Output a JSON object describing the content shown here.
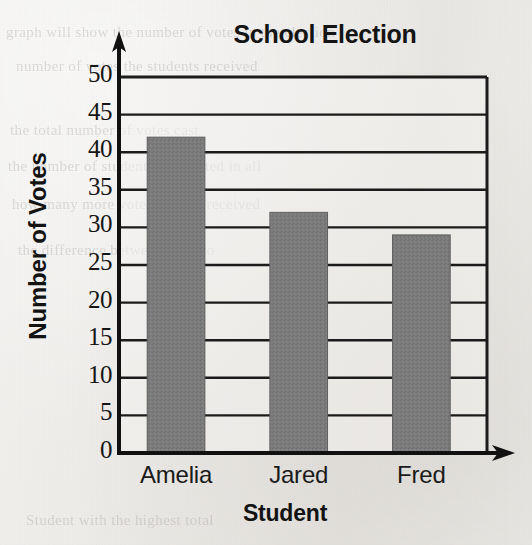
{
  "chart_data": {
    "type": "bar",
    "title": "School Election",
    "xlabel": "Student",
    "ylabel": "Number of Votes",
    "categories": [
      "Amelia",
      "Jared",
      "Fred"
    ],
    "values": [
      42,
      32,
      29
    ],
    "ylim": [
      0,
      50
    ],
    "ytick_values": [
      0,
      5,
      10,
      15,
      20,
      25,
      30,
      35,
      40,
      45,
      50
    ],
    "ytick_labels": [
      "0",
      "5",
      "10",
      "15",
      "20",
      "25",
      "30",
      "35",
      "40",
      "45",
      "50"
    ],
    "grid": "horizontal",
    "legend": "none",
    "bar_color": "#7b7b7b",
    "bar_edge_color": "#5f5f5f",
    "axis_color": "#111111",
    "gridline_color": "#1b1b1b",
    "plot_background": "#f4f3f1"
  },
  "axes": {
    "y_arrow": "up-arrow-icon",
    "x_arrow": "right-arrow-icon"
  },
  "page": {
    "bleed_lines": [
      "graph will show the number of votes in the election",
      "number of votes the students received",
      "the total number of votes cast",
      "the number of students who voted in all",
      "how many more votes Amelia received",
      "the difference between the two",
      "Student with the highest total"
    ]
  }
}
